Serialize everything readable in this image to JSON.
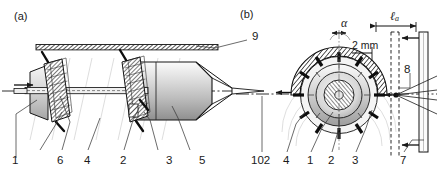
{
  "figure": {
    "panels": [
      {
        "id": "a",
        "label": "(a)"
      },
      {
        "id": "b",
        "label": "(b)"
      }
    ],
    "panel_a": {
      "callouts": [
        {
          "name": "callout-9",
          "text": "9"
        },
        {
          "name": "callout-1",
          "text": "1"
        },
        {
          "name": "callout-6",
          "text": "6"
        },
        {
          "name": "callout-4",
          "text": "4"
        },
        {
          "name": "callout-2",
          "text": "2"
        },
        {
          "name": "callout-3",
          "text": "3"
        },
        {
          "name": "callout-5",
          "text": "5"
        }
      ]
    },
    "panel_b": {
      "callouts": [
        {
          "name": "callout-102",
          "text": "102"
        },
        {
          "name": "callout-4",
          "text": "4"
        },
        {
          "name": "callout-1",
          "text": "1"
        },
        {
          "name": "callout-2",
          "text": "2"
        },
        {
          "name": "callout-3",
          "text": "3"
        },
        {
          "name": "callout-7",
          "text": "7"
        },
        {
          "name": "callout-8",
          "text": "8"
        }
      ],
      "dimensions": [
        {
          "name": "angle-alpha",
          "text": "α"
        },
        {
          "name": "dimension-2mm",
          "text": "2 mm"
        },
        {
          "name": "dimension-ell-a",
          "text": "ℓ",
          "subscript": "a"
        }
      ]
    },
    "colors": {
      "line": "#1a1a1a",
      "background": "#ffffff",
      "hatch": "#3a3a3a",
      "shade_light": "#e6e6e6",
      "shade_mid": "#c4c4c4",
      "shade_dark": "#9a9a9a",
      "faint": "#b8b8b8"
    }
  }
}
